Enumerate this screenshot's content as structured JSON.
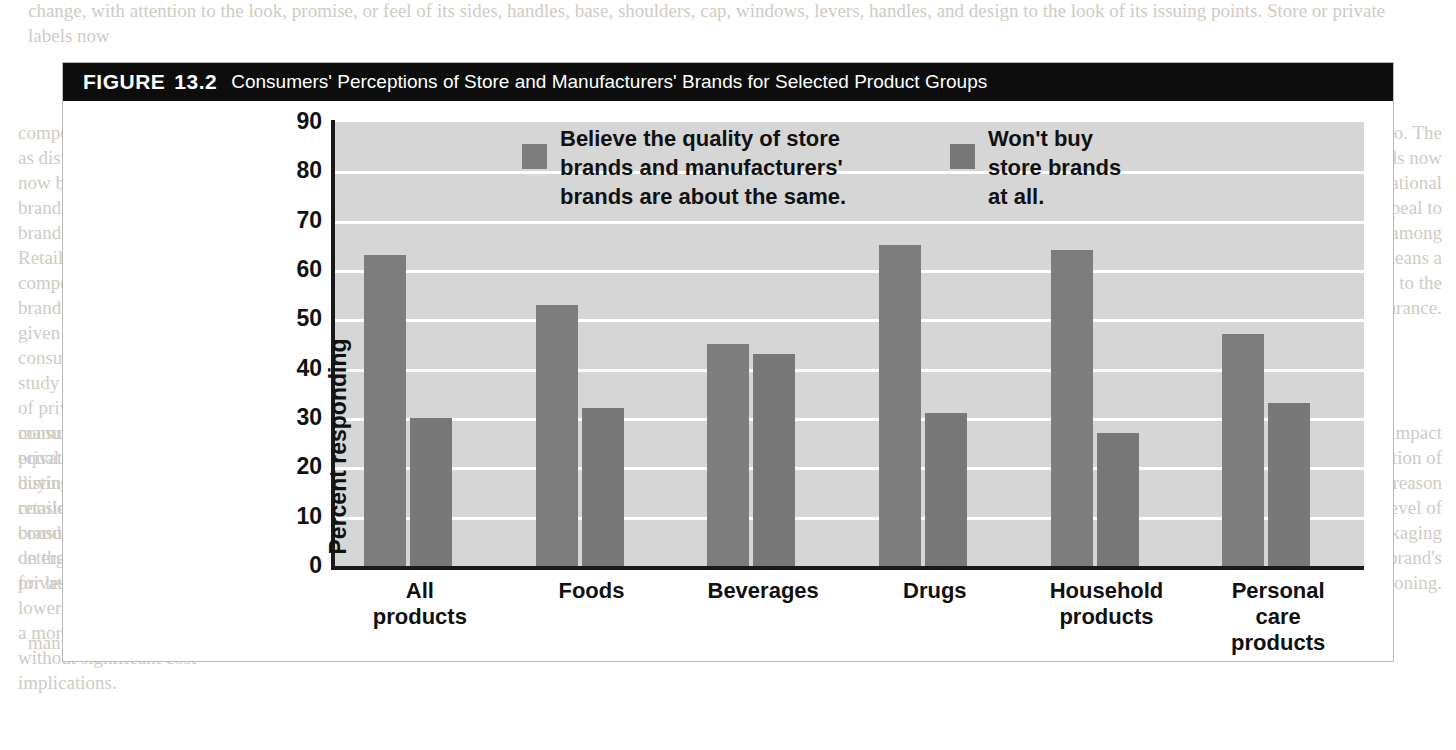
{
  "figure": {
    "label": "FIGURE",
    "number": "13.2",
    "caption": "Consumers' Perceptions of Store and Manufacturers' Brands for Selected Product Groups"
  },
  "colors": {
    "bar_series_1": "#7d7d7d",
    "bar_series_2": "#787878",
    "plot_background": "#d6d6d6",
    "gridline": "#ffffff",
    "title_bar": "#0d0d0d",
    "axis": "#1a1a1a"
  },
  "chart_data": {
    "type": "bar",
    "title": "Consumers' Perceptions of Store and Manufacturers' Brands for Selected Product Groups",
    "xlabel": "",
    "ylabel": "Percent responding",
    "ylim": [
      0,
      90
    ],
    "yticks": [
      90,
      80,
      70,
      60,
      50,
      40,
      30,
      20,
      10,
      0
    ],
    "grid": true,
    "legend_position": "top-inside",
    "categories": [
      "All\nproducts",
      "Foods",
      "Beverages",
      "Drugs",
      "Household\nproducts",
      "Personal\ncare\nproducts"
    ],
    "series": [
      {
        "name": "Believe the quality of store\nbrands and manufacturers'\nbrands are about the same.",
        "values": [
          63,
          53,
          45,
          65,
          64,
          47
        ]
      },
      {
        "name": "Won't buy\nstore brands\nat all.",
        "values": [
          30,
          32,
          43,
          31,
          27,
          33
        ]
      }
    ]
  },
  "page_bleed": {
    "top": "change, with attention to the look, promise, or feel of its sides, handles, base, shoulders, cap, windows, levers, handles, and design to the look of its issuing points. Store or private labels now",
    "left": "compete against national brands as distinct. Many consumers now believe the quality of store brands and manufacturers' brands are about the same. Retailers now may choose to compete against manufacturer brands, and the shelf allocation given to store brands reflects consumer confidence. A recent study of consumer perceptions of private labels revealed that consumers considered them equal in quality, and attributes in buying hard goods. Consumers considered the packaged consumer products such as detergents that were being sold for less than the brand names.",
    "right": "products globally, too. The private-label brands now compete against the national brands and their appeal to consumers is growing among shoppers. Quality means a value-driven approach to the product and its appearance.",
    "mid_left": "manufacturers that the price of private-label products is a distinguishing factor among retailers, but the manufacturers' brand equity provides a premium on their products. The price of private label products may be lower, and the packaging may be a more sophisticated design without significant cost implications.",
    "mid_right": "research demonstrated the impact of packaging on the perception of quality, the value, and the reason to purchase. The level of sophistication of the packaging can indeed reflect the brand's positioning.",
    "bottom": "manufacturer, retailer or consumer. Hence, the level that should help make packaging an increasing focus."
  }
}
